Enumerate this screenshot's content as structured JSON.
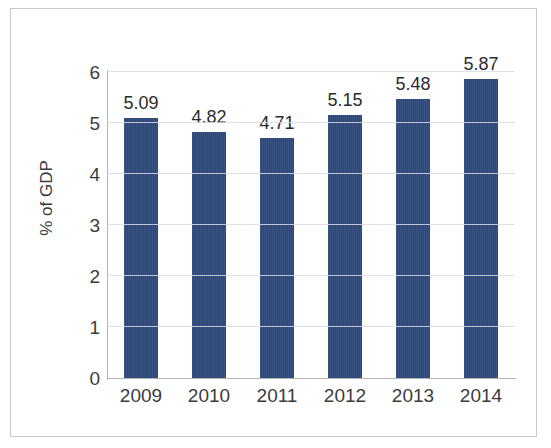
{
  "chart_data": {
    "type": "bar",
    "title": "",
    "subtitle": "",
    "xlabel": "",
    "ylabel": "% of GDP",
    "categories": [
      "2009",
      "2010",
      "2011",
      "2012",
      "2013",
      "2014"
    ],
    "values": [
      5.09,
      4.82,
      4.71,
      5.15,
      5.48,
      5.87
    ],
    "data_labels": [
      "5.09",
      "4.82",
      "4.71",
      "5.15",
      "5.48",
      "5.87"
    ],
    "ylim": [
      0,
      6
    ],
    "yticks": [
      0,
      1,
      2,
      3,
      4,
      5,
      6
    ],
    "ytick_labels": [
      "0",
      "1",
      "2",
      "3",
      "4",
      "5",
      "6"
    ],
    "grid": true,
    "grid_axis": "y",
    "legend": false,
    "legend_position": "none",
    "series": [
      {
        "name": "% of GDP",
        "values": [
          5.09,
          4.82,
          4.71,
          5.15,
          5.48,
          5.87
        ],
        "color": "#2f4a7c"
      }
    ]
  },
  "colors": {
    "bar": "#2f4a7c",
    "axis": "#b3b3b5",
    "gridline": "#d7dbe4",
    "tick_text": "#3b3b3d",
    "label_text": "#2b2b2d",
    "frame": "#c9c9cb",
    "background": "#ffffff"
  }
}
